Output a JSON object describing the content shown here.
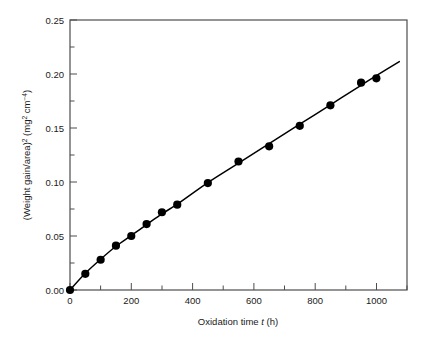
{
  "figure": {
    "background_color": "#ffffff",
    "frame_color": "#4d4d4d",
    "data_color": "#000000"
  },
  "axes": {
    "x": {
      "label_prefix": "Oxidation time ",
      "label_symbol": "t",
      "label_suffix": " (h)",
      "tick_labels": [
        "0",
        "200",
        "400",
        "600",
        "800",
        "1000"
      ],
      "tick_values": [
        0,
        200,
        400,
        600,
        800,
        1000
      ],
      "minor_tick_values": [
        100,
        300,
        500,
        700,
        900
      ],
      "min": 0,
      "max": 1100
    },
    "y": {
      "label_part1": "(Weight gain/area)",
      "label_sup1": "2",
      "label_part2": " (mg",
      "label_sup2": "2",
      "label_part3": " cm",
      "label_sup3": "−4",
      "label_part4": ")",
      "tick_labels": [
        "0.00",
        "0.05",
        "0.10",
        "0.15",
        "0.20",
        "0.25"
      ],
      "tick_values": [
        0.0,
        0.05,
        0.1,
        0.15,
        0.2,
        0.25
      ],
      "minor_tick_values": [
        0.025,
        0.075,
        0.125,
        0.175,
        0.225
      ],
      "min": 0,
      "max": 0.25
    }
  },
  "chart_data": {
    "type": "scatter",
    "title": "",
    "xlabel": "Oxidation time t (h)",
    "ylabel": "(Weight gain/area)² (mg² cm⁻⁴)",
    "xlim": [
      0,
      1100
    ],
    "ylim": [
      0,
      0.25
    ],
    "grid": false,
    "legend": "none",
    "marker": "filled-circle",
    "fit_line": {
      "label": "connecting/fit curve",
      "style": "solid",
      "x": [
        0,
        50,
        100,
        150,
        200,
        250,
        300,
        350,
        450,
        550,
        650,
        750,
        850,
        950,
        1000,
        1075
      ],
      "y": [
        0.0,
        0.0155,
        0.0285,
        0.0405,
        0.0505,
        0.0605,
        0.0705,
        0.0795,
        0.0995,
        0.1175,
        0.1355,
        0.1535,
        0.1715,
        0.1895,
        0.1985,
        0.2115
      ]
    },
    "series": [
      {
        "name": "Oxidation kinetics",
        "x": [
          0,
          50,
          100,
          150,
          200,
          250,
          300,
          350,
          450,
          550,
          650,
          750,
          850,
          950,
          1000
        ],
        "values": [
          0.0,
          0.015,
          0.028,
          0.041,
          0.05,
          0.061,
          0.072,
          0.079,
          0.099,
          0.119,
          0.133,
          0.152,
          0.171,
          0.192,
          0.196
        ]
      }
    ]
  }
}
